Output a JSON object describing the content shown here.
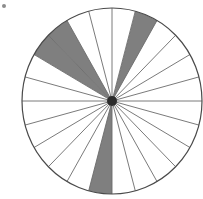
{
  "figure": {
    "type": "sector-diagram",
    "background_color": "#ffffff",
    "outline_color": "#4a4a4a",
    "spoke_color": "#6b6b6b",
    "shaded_color": "#7f7f7f",
    "unshaded_color": "#ffffff",
    "hub_color": "#2b2b2b",
    "corner_mark": "dot"
  },
  "geometry": {
    "center_x": 112,
    "center_y": 101,
    "radius_x": 90,
    "radius_y": 93,
    "sector_count": 24,
    "sector_angle_deg": 15,
    "start_angle_deg": 0,
    "hub_radius": 5,
    "outline_width": 1.2,
    "spoke_width": 0.9
  },
  "chart_data": {
    "type": "pie",
    "xlabel": "",
    "ylabel": "",
    "categories": [
      "S1",
      "S2",
      "S3",
      "S4",
      "S5",
      "S6",
      "S7",
      "S8",
      "S9",
      "S10",
      "S11",
      "S12",
      "S13",
      "S14",
      "S15",
      "S16",
      "S17",
      "S18",
      "S19",
      "S20",
      "S21",
      "S22",
      "S23",
      "S24"
    ],
    "values": [
      1,
      1,
      1,
      1,
      1,
      1,
      1,
      1,
      1,
      1,
      1,
      1,
      1,
      1,
      1,
      1,
      1,
      1,
      1,
      1,
      1,
      1,
      1,
      1
    ],
    "shaded_indices": [
      4,
      8,
      9,
      17
    ],
    "shaded_count": 4,
    "unshaded_count": 20,
    "total_sectors": 24,
    "sector_fraction": "1/24",
    "shaded_fraction": "4/24",
    "legend": [
      {
        "name": "shaded",
        "color": "#7f7f7f",
        "count": 4
      },
      {
        "name": "unshaded",
        "color": "#ffffff",
        "count": 20
      }
    ],
    "sectors": [
      {
        "index": 0,
        "start_deg": 0,
        "end_deg": 15,
        "shaded": false
      },
      {
        "index": 1,
        "start_deg": 15,
        "end_deg": 30,
        "shaded": false
      },
      {
        "index": 2,
        "start_deg": 30,
        "end_deg": 45,
        "shaded": false
      },
      {
        "index": 3,
        "start_deg": 45,
        "end_deg": 60,
        "shaded": false
      },
      {
        "index": 4,
        "start_deg": 60,
        "end_deg": 75,
        "shaded": true
      },
      {
        "index": 5,
        "start_deg": 75,
        "end_deg": 90,
        "shaded": false
      },
      {
        "index": 6,
        "start_deg": 90,
        "end_deg": 105,
        "shaded": false
      },
      {
        "index": 7,
        "start_deg": 105,
        "end_deg": 120,
        "shaded": false
      },
      {
        "index": 8,
        "start_deg": 120,
        "end_deg": 135,
        "shaded": true
      },
      {
        "index": 9,
        "start_deg": 135,
        "end_deg": 150,
        "shaded": true
      },
      {
        "index": 10,
        "start_deg": 150,
        "end_deg": 165,
        "shaded": false
      },
      {
        "index": 11,
        "start_deg": 165,
        "end_deg": 180,
        "shaded": false
      },
      {
        "index": 12,
        "start_deg": 180,
        "end_deg": 195,
        "shaded": false
      },
      {
        "index": 13,
        "start_deg": 195,
        "end_deg": 210,
        "shaded": false
      },
      {
        "index": 14,
        "start_deg": 210,
        "end_deg": 225,
        "shaded": false
      },
      {
        "index": 15,
        "start_deg": 225,
        "end_deg": 240,
        "shaded": false
      },
      {
        "index": 16,
        "start_deg": 240,
        "end_deg": 255,
        "shaded": false
      },
      {
        "index": 17,
        "start_deg": 255,
        "end_deg": 270,
        "shaded": true
      },
      {
        "index": 18,
        "start_deg": 270,
        "end_deg": 285,
        "shaded": false
      },
      {
        "index": 19,
        "start_deg": 285,
        "end_deg": 300,
        "shaded": false
      },
      {
        "index": 20,
        "start_deg": 300,
        "end_deg": 315,
        "shaded": false
      },
      {
        "index": 21,
        "start_deg": 315,
        "end_deg": 330,
        "shaded": false
      },
      {
        "index": 22,
        "start_deg": 330,
        "end_deg": 345,
        "shaded": false
      },
      {
        "index": 23,
        "start_deg": 345,
        "end_deg": 360,
        "shaded": false
      }
    ]
  }
}
